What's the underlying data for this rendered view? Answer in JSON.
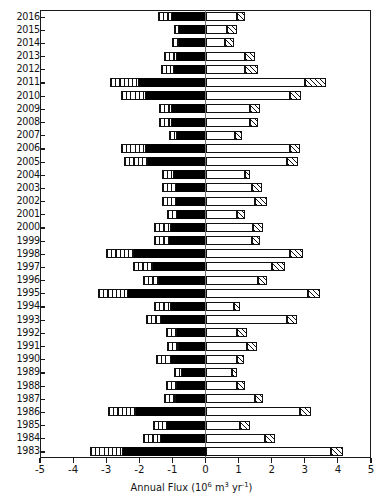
{
  "chart_data": {
    "type": "bar",
    "title": "",
    "subtitle": "",
    "orientation": "horizontal",
    "stacking": "diverging-stacked",
    "xlabel": "Annual Flux (10^6 m^3 yr^-1)",
    "xlabel_parts": {
      "text_main": "Annual Flux (10",
      "exp1": "6",
      "text_mid": " m",
      "exp2": "3",
      "text_mid2": " yr",
      "exp3": "-1",
      "text_end": ")"
    },
    "ylabel": "",
    "xlim": [
      -5,
      5
    ],
    "xticks": [
      -5,
      -4,
      -3,
      -2,
      -1,
      0,
      1,
      2,
      3,
      4,
      5
    ],
    "xtick_labels": [
      "-5",
      "-4",
      "-3",
      "-2",
      "-1",
      "0",
      "1",
      "2",
      "3",
      "4",
      "5"
    ],
    "grid": false,
    "legend_position": "none",
    "categories": [
      "2016",
      "2015",
      "2014",
      "2013",
      "2012",
      "2011",
      "2010",
      "2009",
      "2008",
      "2007",
      "2006",
      "2005",
      "2004",
      "2003",
      "2002",
      "2001",
      "2000",
      "1999",
      "1998",
      "1997",
      "1996",
      "1995",
      "1994",
      "1993",
      "1992",
      "1991",
      "1990",
      "1989",
      "1988",
      "1987",
      "1986",
      "1985",
      "1984",
      "1983"
    ],
    "series": [
      {
        "name": "negative-outer-striped",
        "fill": "vertical-striped",
        "values": [
          -1.45,
          -0.95,
          -1.0,
          -1.25,
          -1.35,
          -2.9,
          -2.55,
          -1.4,
          -1.4,
          -1.1,
          -2.55,
          -2.45,
          -1.3,
          -1.3,
          -1.3,
          -1.15,
          -1.55,
          -1.55,
          -3.0,
          -2.2,
          -1.9,
          -3.25,
          -1.55,
          -1.8,
          -1.2,
          -1.15,
          -1.5,
          -0.95,
          -1.2,
          -1.25,
          -2.95,
          -1.6,
          -1.9,
          -3.5
        ]
      },
      {
        "name": "negative-inner-black",
        "fill": "solid-black",
        "values": [
          -1.0,
          -0.8,
          -0.8,
          -0.85,
          -0.95,
          -2.0,
          -1.8,
          -1.0,
          -1.0,
          -0.85,
          -1.8,
          -1.75,
          -0.95,
          -0.9,
          -0.9,
          -0.85,
          -1.05,
          -1.1,
          -2.15,
          -1.6,
          -1.4,
          -2.35,
          -1.05,
          -1.35,
          -0.85,
          -0.8,
          -1.05,
          -0.7,
          -0.85,
          -0.9,
          -2.1,
          -1.15,
          -1.35,
          -2.5
        ]
      },
      {
        "name": "positive-inner-white",
        "fill": "white",
        "values": [
          0.95,
          0.65,
          0.6,
          1.2,
          1.2,
          3.0,
          2.55,
          1.35,
          1.35,
          0.9,
          2.55,
          2.45,
          1.2,
          1.4,
          1.5,
          0.95,
          1.45,
          1.4,
          2.55,
          2.0,
          1.6,
          3.1,
          0.85,
          2.45,
          0.95,
          1.25,
          0.95,
          0.8,
          0.95,
          1.5,
          2.85,
          1.05,
          1.8,
          3.8
        ]
      },
      {
        "name": "positive-outer-hatched",
        "fill": "diagonal-hatched",
        "values": [
          1.2,
          0.95,
          0.85,
          1.5,
          1.6,
          3.65,
          2.9,
          1.65,
          1.6,
          1.1,
          2.85,
          2.8,
          1.35,
          1.7,
          1.85,
          1.2,
          1.75,
          1.65,
          2.95,
          2.4,
          1.85,
          3.45,
          1.05,
          2.75,
          1.25,
          1.55,
          1.15,
          0.95,
          1.2,
          1.75,
          3.2,
          1.35,
          2.1,
          4.15
        ]
      }
    ]
  },
  "colors": {
    "black": "#000000",
    "white": "#ffffff",
    "outline": "#111111",
    "axis": "#1a1a1a",
    "zero_line": "#6f6f6f",
    "text": "#141414"
  }
}
